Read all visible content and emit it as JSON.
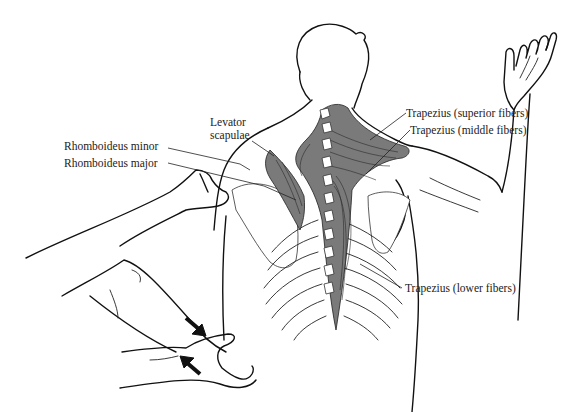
{
  "figure": {
    "type": "anatomical illustration",
    "colors": {
      "line": "#111111",
      "muscle_fill": "#7a7a7a",
      "background": "#ffffff"
    }
  },
  "labels": {
    "levator_scapulae_line1": "Levator",
    "levator_scapulae_line2": "scapulae",
    "rhomboideus_minor": "Rhomboideus minor",
    "rhomboideus_major": "Rhomboideus major",
    "trapezius_superior": "Trapezius (superior fibers)",
    "trapezius_middle": "Trapezius (middle fibers)",
    "trapezius_lower": "Trapezius (lower fibers)"
  },
  "annotations": {
    "arrows": [
      {
        "name": "push-arrow-upper",
        "direction": "down-right"
      },
      {
        "name": "push-arrow-lower",
        "direction": "up-left"
      }
    ]
  }
}
